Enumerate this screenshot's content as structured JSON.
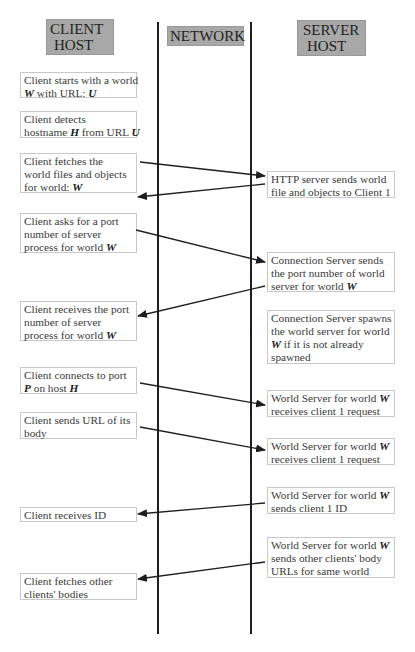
{
  "headers": {
    "client": [
      "CLIENT",
      "HOST"
    ],
    "network": "NETWORK",
    "server": [
      "SERVER",
      "HOST"
    ]
  },
  "client_steps": [
    {
      "lines": [
        [
          {
            "t": "Client starts with a world"
          }
        ],
        [
          {
            "t": "W",
            "v": 1
          },
          {
            "t": " with URL: "
          },
          {
            "t": "U",
            "v": 1
          }
        ]
      ]
    },
    {
      "lines": [
        [
          {
            "t": "Client detects"
          }
        ],
        [
          {
            "t": "hostname "
          },
          {
            "t": "H",
            "v": 1
          },
          {
            "t": " from URL "
          },
          {
            "t": "U",
            "v": 1
          }
        ]
      ]
    },
    {
      "lines": [
        [
          {
            "t": "Client fetches the"
          }
        ],
        [
          {
            "t": "world files and objects"
          }
        ],
        [
          {
            "t": "for world:  "
          },
          {
            "t": "W",
            "v": 1
          }
        ]
      ]
    },
    {
      "lines": [
        [
          {
            "t": "Client asks for a port"
          }
        ],
        [
          {
            "t": " number of server"
          }
        ],
        [
          {
            "t": "process for world  "
          },
          {
            "t": "W",
            "v": 1
          }
        ]
      ]
    },
    {
      "lines": [
        [
          {
            "t": "Client receives the port"
          }
        ],
        [
          {
            "t": " number of server"
          }
        ],
        [
          {
            "t": "process for world  "
          },
          {
            "t": "W",
            "v": 1
          }
        ]
      ]
    },
    {
      "lines": [
        [
          {
            "t": "Client connects to port"
          }
        ],
        [
          {
            "t": "P",
            "v": 1
          },
          {
            "t": " on host "
          },
          {
            "t": "H",
            "v": 1
          }
        ]
      ]
    },
    {
      "lines": [
        [
          {
            "t": "Client sends URL of its"
          }
        ],
        [
          {
            "t": "body"
          }
        ]
      ]
    },
    {
      "lines": [
        [
          {
            "t": "Client receives ID"
          }
        ]
      ]
    },
    {
      "lines": [
        [
          {
            "t": "Client fetches other"
          }
        ],
        [
          {
            "t": "clients' bodies"
          }
        ]
      ]
    }
  ],
  "server_steps": [
    {
      "lines": [
        [
          {
            "t": "HTTP server sends world"
          }
        ],
        [
          {
            "t": "file and objects to Client 1"
          }
        ]
      ]
    },
    {
      "lines": [
        [
          {
            "t": "Connection Server  sends"
          }
        ],
        [
          {
            "t": "the port number of world"
          }
        ],
        [
          {
            "t": "server for world "
          },
          {
            "t": "W",
            "v": 1
          }
        ]
      ]
    },
    {
      "lines": [
        [
          {
            "t": "Connection Server spawns"
          }
        ],
        [
          {
            "t": "the world server for world"
          }
        ],
        [
          {
            "t": "W",
            "v": 1
          },
          {
            "t": " if it is not already"
          }
        ],
        [
          {
            "t": "spawned"
          }
        ]
      ]
    },
    {
      "lines": [
        [
          {
            "t": "World Server for world "
          },
          {
            "t": "W",
            "v": 1
          }
        ],
        [
          {
            "t": "receives client 1 request"
          }
        ]
      ]
    },
    {
      "lines": [
        [
          {
            "t": "World Server for world "
          },
          {
            "t": "W",
            "v": 1
          }
        ],
        [
          {
            "t": "receives client 1 request"
          }
        ]
      ]
    },
    {
      "lines": [
        [
          {
            "t": "World Server for world "
          },
          {
            "t": "W",
            "v": 1
          }
        ],
        [
          {
            "t": "sends client 1 ID"
          }
        ]
      ]
    },
    {
      "lines": [
        [
          {
            "t": "World Server for world "
          },
          {
            "t": "W",
            "v": 1
          }
        ],
        [
          {
            "t": "sends other clients' body"
          }
        ],
        [
          {
            "t": "URLs for same world"
          }
        ]
      ]
    }
  ],
  "messages": [
    {
      "from": "client_steps.2",
      "to": "server_steps.0",
      "direction": "to-server"
    },
    {
      "from": "server_steps.0",
      "to": "client_steps.2",
      "direction": "to-client"
    },
    {
      "from": "client_steps.3",
      "to": "server_steps.1",
      "direction": "to-server"
    },
    {
      "from": "server_steps.1",
      "to": "client_steps.4",
      "direction": "to-client"
    },
    {
      "from": "client_steps.5",
      "to": "server_steps.3",
      "direction": "to-server"
    },
    {
      "from": "client_steps.6",
      "to": "server_steps.4",
      "direction": "to-server"
    },
    {
      "from": "server_steps.5",
      "to": "client_steps.7",
      "direction": "to-client"
    },
    {
      "from": "server_steps.6",
      "to": "client_steps.8",
      "direction": "to-client"
    }
  ],
  "colors": {
    "header_fill": "#a8a8a8",
    "lifeline": "#1e1e1e",
    "arrow": "#1e1e1e",
    "box_border": "#c8c8c8"
  }
}
